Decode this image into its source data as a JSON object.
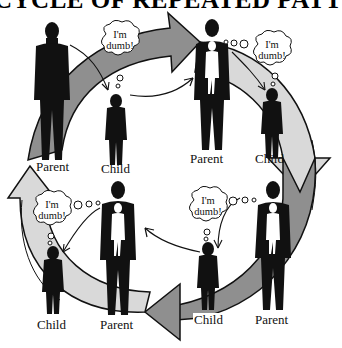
{
  "diagram": {
    "title": "CYCLE OF REPEATED PATTERNS",
    "thought_text_line1": "I'm",
    "thought_text_line2": "dumb!",
    "colors": {
      "dark_arrow": "#8f8f8f",
      "light_arrow": "#d9d9d9",
      "outline": "#111111",
      "figure": "#111111",
      "inner_figure": "#ffffff",
      "background": "#ffffff"
    },
    "groups": [
      {
        "position": "top-left",
        "parent_label": "Parent",
        "child_label": "Child",
        "bubble": "I'm dumb!",
        "parent_has_inner_child": false
      },
      {
        "position": "top-right",
        "parent_label": "Parent",
        "child_label": "Child",
        "bubble": "I'm dumb!",
        "parent_has_inner_child": true
      },
      {
        "position": "bottom-right",
        "parent_label": "Parent",
        "child_label": "Child",
        "bubble": "I'm dumb!",
        "parent_has_inner_child": true
      },
      {
        "position": "bottom-left",
        "parent_label": "Parent",
        "child_label": "Child",
        "bubble": "I'm dumb!",
        "parent_has_inner_child": true
      }
    ]
  }
}
